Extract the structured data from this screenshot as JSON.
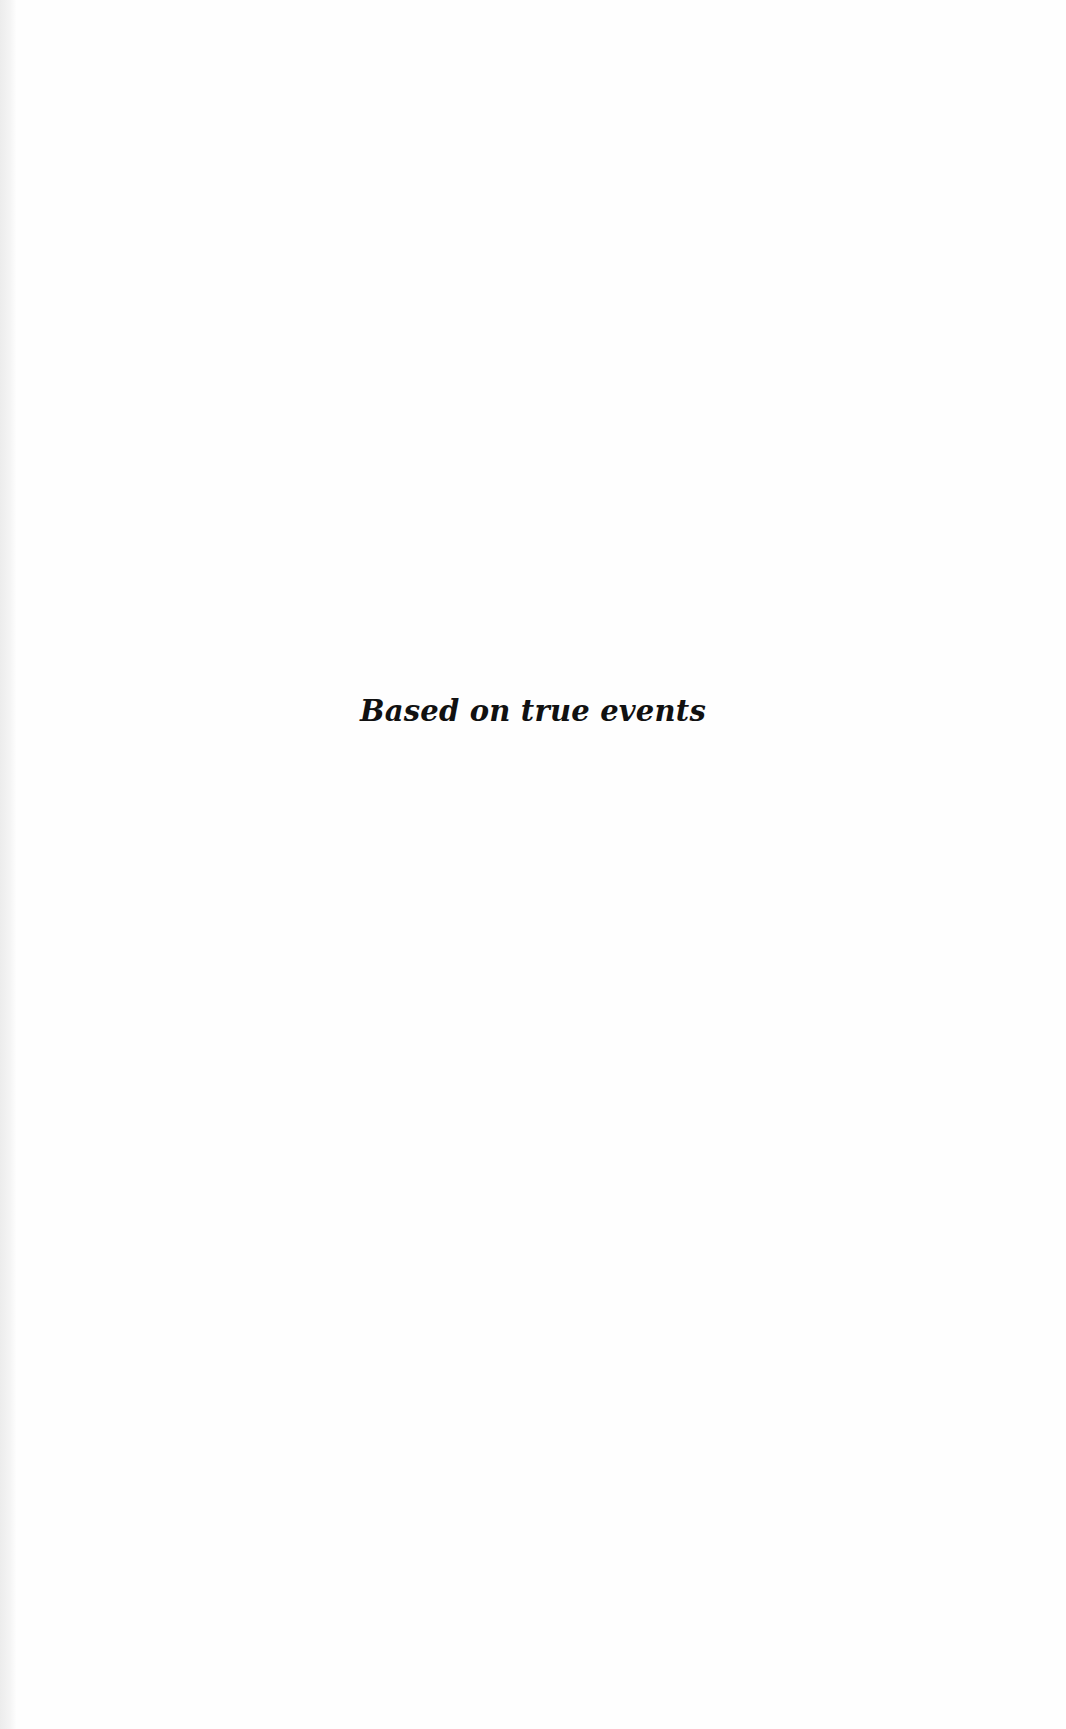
{
  "page": {
    "epigraph": "Based on true events"
  }
}
